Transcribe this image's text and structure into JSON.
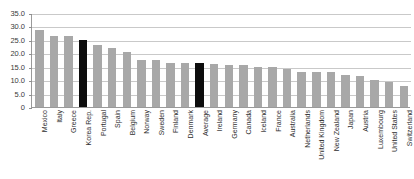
{
  "chart_data": {
    "type": "bar",
    "title": "",
    "xlabel": "",
    "ylabel": "",
    "ylim": [
      0,
      35
    ],
    "ytick_labels": [
      "35.0",
      "30.0",
      "25.0",
      "20.0",
      "15.0",
      "10.0",
      "5.0",
      "0"
    ],
    "ytick_values": [
      35,
      30,
      25,
      20,
      15,
      10,
      5,
      0
    ],
    "grid": true,
    "legend": "none",
    "bar_color": "#a8a8a8",
    "highlight_color": "#0d0d0d",
    "highlight_categories": [
      "Korea Rep.",
      "Average"
    ],
    "categories": [
      "Mexico",
      "Italy",
      "Greece",
      "Korea Rep.",
      "Portugal",
      "Spain",
      "Belgium",
      "Norway",
      "Sweden",
      "Finland",
      "Denmark",
      "Average",
      "Ireland",
      "Germany",
      "Canada",
      "Iceland",
      "France",
      "Australia",
      "Netherlands",
      "United Kingdom",
      "New Zealand",
      "Japan",
      "Austria",
      "Luxembourg",
      "United States",
      "Switzerland"
    ],
    "values": [
      28.5,
      26.5,
      26.5,
      25.0,
      23.0,
      22.0,
      20.5,
      17.5,
      17.5,
      16.5,
      16.5,
      16.5,
      16.0,
      15.5,
      15.5,
      15.0,
      15.0,
      14.0,
      13.0,
      13.0,
      13.0,
      12.0,
      11.5,
      10.0,
      9.5,
      8.0
    ]
  }
}
